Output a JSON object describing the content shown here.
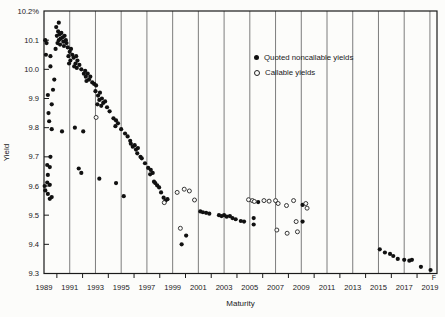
{
  "chart_data": {
    "type": "scatter",
    "title": "",
    "xlabel": "Maturity",
    "ylabel": "Yield",
    "xlim": [
      1989,
      2019.55
    ],
    "ylim": [
      9.3,
      10.2
    ],
    "grid": "vertical gridlines every 2 years; no horizontal gridlines",
    "x_tick_labels": [
      "1989",
      "1991",
      "1993",
      "1995",
      "1997",
      "1999",
      "2001",
      "2003",
      "2005",
      "2007",
      "2009",
      "2011",
      "2013",
      "2015",
      "2017",
      "2019"
    ],
    "x_tick_values": [
      1989,
      1991,
      1993,
      1995,
      1997,
      1999,
      2001,
      2003,
      2005,
      2007,
      2009,
      2011,
      2013,
      2015,
      2017,
      2019
    ],
    "x_minor_tick_values": [
      1990,
      1992,
      1994,
      1996,
      1998,
      2000,
      2002,
      2004,
      2006,
      2008,
      2010,
      2012,
      2014,
      2016,
      2018
    ],
    "y_tick_labels": [
      "10.2%",
      "10.1",
      "10.0",
      "9.9",
      "9.8",
      "9.7",
      "9.6",
      "9.5",
      "9.4",
      "9.3"
    ],
    "y_tick_values": [
      10.2,
      10.1,
      10.0,
      9.9,
      9.8,
      9.7,
      9.6,
      9.5,
      9.4,
      9.3
    ],
    "forecast_label": "F",
    "legend": {
      "position": "inside-upper-middle",
      "entries": [
        {
          "label": "Quoted noncallable yields",
          "marker": "filled-circle"
        },
        {
          "label": "Callable yields",
          "marker": "open-circle"
        }
      ]
    },
    "series": [
      {
        "name": "Quoted noncallable yields",
        "marker": "filled-circle",
        "color": "#111111",
        "points": [
          [
            1989.1,
            10.1
          ],
          [
            1989.2,
            10.09
          ],
          [
            1989.15,
            10.05
          ],
          [
            1989.5,
            10.045
          ],
          [
            1989.5,
            10.01
          ],
          [
            1989.8,
            9.965
          ],
          [
            1989.7,
            9.93
          ],
          [
            1989.3,
            9.912
          ],
          [
            1989.6,
            9.88
          ],
          [
            1989.35,
            9.85
          ],
          [
            1989.4,
            9.822
          ],
          [
            1989.6,
            9.795
          ],
          [
            1989.5,
            9.7
          ],
          [
            1989.25,
            9.672
          ],
          [
            1989.45,
            9.665
          ],
          [
            1989.3,
            9.638
          ],
          [
            1989.25,
            9.612
          ],
          [
            1989.45,
            9.604
          ],
          [
            1989.05,
            9.6
          ],
          [
            1989.1,
            9.585
          ],
          [
            1989.3,
            9.573
          ],
          [
            1989.6,
            9.562
          ],
          [
            1989.45,
            9.556
          ],
          [
            1990.15,
            10.16
          ],
          [
            1989.95,
            10.145
          ],
          [
            1990.1,
            10.13
          ],
          [
            1990.0,
            10.115
          ],
          [
            1990.2,
            10.12
          ],
          [
            1990.35,
            10.125
          ],
          [
            1990.3,
            10.105
          ],
          [
            1990.15,
            10.1
          ],
          [
            1990.45,
            10.11
          ],
          [
            1990.5,
            10.095
          ],
          [
            1990.6,
            10.115
          ],
          [
            1990.55,
            10.08
          ],
          [
            1990.7,
            10.1
          ],
          [
            1990.25,
            10.085
          ],
          [
            1990.05,
            10.09
          ],
          [
            1990.75,
            10.09
          ],
          [
            1989.9,
            10.07
          ],
          [
            1990.85,
            10.075
          ],
          [
            1991.0,
            10.06
          ],
          [
            1991.1,
            10.07
          ],
          [
            1991.2,
            10.05
          ],
          [
            1990.9,
            10.045
          ],
          [
            1991.05,
            10.03
          ],
          [
            1991.3,
            10.04
          ],
          [
            1991.5,
            10.045
          ],
          [
            1991.45,
            10.02
          ],
          [
            1991.6,
            10.03
          ],
          [
            1991.55,
            10.005
          ],
          [
            1991.75,
            10.015
          ],
          [
            1991.9,
            10.0
          ],
          [
            1991.35,
            10.01
          ],
          [
            1990.95,
            10.02
          ],
          [
            1992.1,
            9.985
          ],
          [
            1992.25,
            9.975
          ],
          [
            1992.4,
            9.985
          ],
          [
            1992.3,
            9.96
          ],
          [
            1992.5,
            9.965
          ],
          [
            1992.6,
            9.975
          ],
          [
            1992.75,
            9.955
          ],
          [
            1992.9,
            9.95
          ],
          [
            1992.2,
            9.995
          ],
          [
            1993.05,
            9.945
          ],
          [
            1993.0,
            9.925
          ],
          [
            1993.2,
            9.91
          ],
          [
            1993.35,
            9.92
          ],
          [
            1993.3,
            9.895
          ],
          [
            1993.5,
            9.9
          ],
          [
            1993.6,
            9.885
          ],
          [
            1993.75,
            9.89
          ],
          [
            1993.45,
            9.875
          ],
          [
            1993.9,
            9.87
          ],
          [
            1993.15,
            9.88
          ],
          [
            1994.1,
            9.856
          ],
          [
            1994.4,
            9.832
          ],
          [
            1994.6,
            9.825
          ],
          [
            1994.75,
            9.815
          ],
          [
            1994.55,
            9.805
          ],
          [
            1995.0,
            9.795
          ],
          [
            1995.3,
            9.78
          ],
          [
            1995.5,
            9.77
          ],
          [
            1995.7,
            9.755
          ],
          [
            1995.75,
            9.745
          ],
          [
            1995.9,
            9.735
          ],
          [
            1996.05,
            9.74
          ],
          [
            1996.15,
            9.725
          ],
          [
            1996.3,
            9.73
          ],
          [
            1996.25,
            9.712
          ],
          [
            1996.5,
            9.7
          ],
          [
            1996.6,
            9.695
          ],
          [
            1996.85,
            9.678
          ],
          [
            1997.1,
            9.662
          ],
          [
            1997.3,
            9.655
          ],
          [
            1997.45,
            9.645
          ],
          [
            1997.25,
            9.64
          ],
          [
            1997.55,
            9.615
          ],
          [
            1997.65,
            9.61
          ],
          [
            1997.8,
            9.602
          ],
          [
            1997.95,
            9.595
          ],
          [
            1998.1,
            9.578
          ],
          [
            1998.3,
            9.56
          ],
          [
            1998.45,
            9.55
          ],
          [
            1998.6,
            9.555
          ],
          [
            1990.4,
            9.787
          ],
          [
            1991.4,
            9.8
          ],
          [
            1992.05,
            9.787
          ],
          [
            1991.7,
            9.66
          ],
          [
            1991.9,
            9.645
          ],
          [
            1993.3,
            9.625
          ],
          [
            1994.6,
            9.61
          ],
          [
            1995.2,
            9.565
          ],
          [
            1999.7,
            9.4
          ],
          [
            2000.05,
            9.43
          ],
          [
            2001.15,
            9.513
          ],
          [
            2001.35,
            9.51
          ],
          [
            2001.6,
            9.508
          ],
          [
            2001.85,
            9.505
          ],
          [
            2002.6,
            9.5
          ],
          [
            2002.8,
            9.497
          ],
          [
            2003.0,
            9.5
          ],
          [
            2003.2,
            9.495
          ],
          [
            2003.45,
            9.497
          ],
          [
            2003.65,
            9.49
          ],
          [
            2003.9,
            9.486
          ],
          [
            2004.3,
            9.48
          ],
          [
            2004.55,
            9.478
          ],
          [
            2005.3,
            9.49
          ],
          [
            2005.3,
            9.468
          ],
          [
            2005.65,
            9.545
          ],
          [
            2009.1,
            9.535
          ],
          [
            2009.1,
            9.478
          ],
          [
            2015.1,
            9.383
          ],
          [
            2015.5,
            9.372
          ],
          [
            2015.9,
            9.367
          ],
          [
            2016.15,
            9.36
          ],
          [
            2016.5,
            9.35
          ],
          [
            2017.0,
            9.347
          ],
          [
            2017.4,
            9.344
          ],
          [
            2017.6,
            9.347
          ],
          [
            2018.3,
            9.323
          ],
          [
            2019.05,
            9.312
          ]
        ]
      },
      {
        "name": "Callable yields",
        "marker": "open-circle",
        "color": "#222222",
        "points": [
          [
            1993.05,
            9.835
          ],
          [
            1998.35,
            9.543
          ],
          [
            1999.35,
            9.578
          ],
          [
            1999.9,
            9.589
          ],
          [
            2000.3,
            9.583
          ],
          [
            2000.7,
            9.552
          ],
          [
            1999.6,
            9.455
          ],
          [
            2004.9,
            9.553
          ],
          [
            2005.2,
            9.55
          ],
          [
            2005.35,
            9.547
          ],
          [
            2006.1,
            9.55
          ],
          [
            2006.5,
            9.548
          ],
          [
            2007.0,
            9.55
          ],
          [
            2007.2,
            9.54
          ],
          [
            2007.85,
            9.533
          ],
          [
            2008.4,
            9.55
          ],
          [
            2009.35,
            9.54
          ],
          [
            2009.45,
            9.524
          ],
          [
            2007.1,
            9.449
          ],
          [
            2007.9,
            9.438
          ],
          [
            2008.7,
            9.443
          ],
          [
            2008.6,
            9.478
          ]
        ]
      }
    ]
  }
}
